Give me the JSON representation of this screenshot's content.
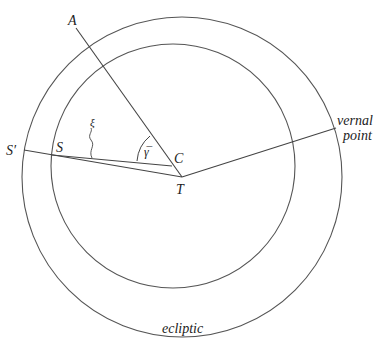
{
  "diagram": {
    "labels": {
      "A": "A",
      "S_prime": "S′",
      "S": "S",
      "xi": "ξ",
      "gamma_bar": "γ̅",
      "C": "C",
      "T": "T",
      "vernal_line1": "vernal",
      "vernal_line2": "point",
      "ecliptic": "ecliptic"
    },
    "colors": {
      "stroke": "#444444",
      "text": "#222222"
    }
  }
}
